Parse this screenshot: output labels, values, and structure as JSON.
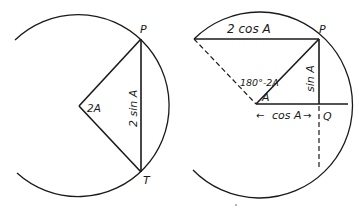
{
  "figures": [
    {
      "id": "left",
      "labels": {
        "point_top": "P",
        "point_bottom": "T",
        "angle": "2A",
        "chord": "2 sin A"
      }
    },
    {
      "id": "right",
      "labels": {
        "point_top": "P",
        "point_q": "Q",
        "top_chord": "2 cos A",
        "angle_supplement": "180°-2A",
        "angle": "A",
        "vertical": "sin A",
        "horizontal": "cos A",
        "arrow_left": "←",
        "arrow_right": "→"
      }
    }
  ],
  "colors": {
    "ink": "#1a1a1a",
    "background": "#ffffff"
  }
}
